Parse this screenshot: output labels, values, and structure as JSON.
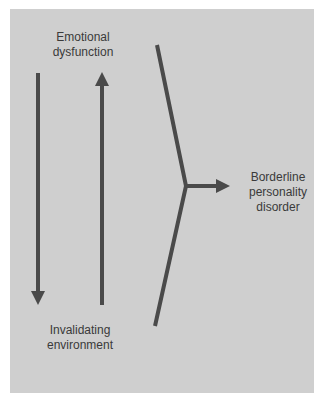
{
  "diagram": {
    "nodes": {
      "emotional_dysfunction": {
        "line1": "Emotional",
        "line2": "dysfunction"
      },
      "invalidating_environment": {
        "line1": "Invalidating",
        "line2": "environment"
      },
      "outcome": {
        "line1": "Borderline",
        "line2": "personality",
        "line3": "disorder"
      }
    },
    "edges": [
      {
        "from": "emotional_dysfunction",
        "to": "invalidating_environment",
        "direction": "down"
      },
      {
        "from": "invalidating_environment",
        "to": "emotional_dysfunction",
        "direction": "up"
      },
      {
        "from": "both",
        "to": "outcome",
        "direction": "right",
        "shape": "converging-bracket"
      }
    ],
    "colors": {
      "background": "#cfcfcf",
      "line": "#4a4a4a",
      "text": "#3a3a3a"
    }
  }
}
